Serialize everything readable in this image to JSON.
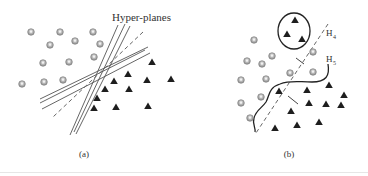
{
  "figure": {
    "panel_a": {
      "caption": "(a)",
      "annotation": "Hyper-planes",
      "circles": [
        [
          31,
          32
        ],
        [
          60,
          32
        ],
        [
          93,
          32
        ],
        [
          50,
          45
        ],
        [
          75,
          41
        ],
        [
          100,
          44
        ],
        [
          43,
          63
        ],
        [
          69,
          62
        ],
        [
          94,
          57
        ],
        [
          22,
          84
        ],
        [
          44,
          82
        ],
        [
          63,
          80
        ]
      ],
      "triangles": [
        [
          152,
          62
        ],
        [
          128,
          74
        ],
        [
          114,
          81
        ],
        [
          147,
          80
        ],
        [
          171,
          79
        ],
        [
          105,
          89
        ],
        [
          129,
          89
        ],
        [
          97,
          98
        ],
        [
          94,
          108
        ],
        [
          116,
          107
        ],
        [
          148,
          106
        ]
      ],
      "solid_lines": [
        [
          [
            118,
            25
          ],
          [
            70,
            135
          ]
        ],
        [
          [
            125,
            24
          ],
          [
            74,
            132
          ]
        ],
        [
          [
            130,
            26
          ],
          [
            76,
            134
          ]
        ],
        [
          [
            148,
            47
          ],
          [
            40,
            99
          ]
        ],
        [
          [
            150,
            53
          ],
          [
            42,
            109
          ]
        ],
        [
          [
            145,
            50
          ],
          [
            40,
            103
          ]
        ]
      ],
      "dashed_lines": [
        [
          [
            143,
            32
          ],
          [
            53,
            117
          ]
        ]
      ]
    },
    "panel_b": {
      "caption": "(b)",
      "labels": [
        {
          "text": "H",
          "sub": "4",
          "x": 326,
          "y": 36
        },
        {
          "text": "H",
          "sub": "5",
          "x": 326,
          "y": 62
        }
      ],
      "circles": [
        [
          254,
          40
        ],
        [
          247,
          61
        ],
        [
          262,
          64
        ],
        [
          272,
          56
        ],
        [
          241,
          80
        ],
        [
          266,
          79
        ],
        [
          290,
          73
        ],
        [
          313,
          72
        ],
        [
          313,
          52
        ],
        [
          241,
          103
        ],
        [
          261,
          97
        ],
        [
          250,
          118
        ]
      ],
      "triangles": [
        [
          279,
          91
        ],
        [
          307,
          90
        ],
        [
          329,
          85
        ],
        [
          344,
          95
        ],
        [
          309,
          103
        ],
        [
          326,
          104
        ],
        [
          341,
          105
        ],
        [
          291,
          111
        ],
        [
          319,
          122
        ],
        [
          297,
          125
        ],
        [
          275,
          128
        ]
      ],
      "cluster_triangles": [
        [
          295,
          20
        ],
        [
          287,
          34
        ],
        [
          302,
          39
        ]
      ],
      "cluster_ellipse": {
        "cx": 294,
        "cy": 31,
        "rx": 16,
        "ry": 18
      }
    }
  }
}
